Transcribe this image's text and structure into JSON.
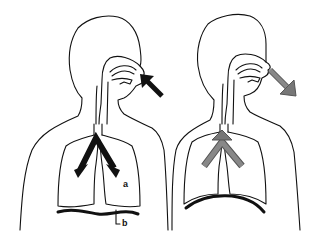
{
  "diagram": {
    "figures": [
      {
        "id": "inhalation",
        "arrow_color": "#111111",
        "arrows": [
          "air-into-nose",
          "air-into-lungs-left",
          "air-into-lungs-right"
        ],
        "diaphragm": "flattened",
        "labels": [
          {
            "text": "a",
            "target": "lung"
          },
          {
            "text": "b",
            "target": "diaphragm"
          }
        ]
      },
      {
        "id": "exhalation",
        "arrow_color": "#777777",
        "arrows": [
          "air-out-of-lungs",
          "air-out-of-nose"
        ],
        "diaphragm": "domed",
        "labels": []
      }
    ],
    "label_a": "a",
    "label_b": "b"
  }
}
